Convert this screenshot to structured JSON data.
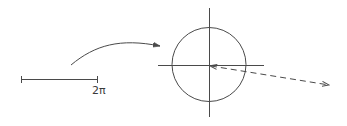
{
  "diagram": {
    "scale_bar": {
      "label": "2π"
    },
    "elements": [
      {
        "type": "scale-bar",
        "description": "horizontal segment with end ticks",
        "label": "2π"
      },
      {
        "type": "curved-arrow",
        "description": "mapping arrow from scale bar toward circle"
      },
      {
        "type": "unit-circle",
        "description": "circle centered on crossed axes"
      },
      {
        "type": "axes",
        "description": "horizontal and vertical axis lines through circle center"
      },
      {
        "type": "dashed-arrow",
        "description": "dashed double-headed arrow from circle center extending right-downward"
      }
    ],
    "colors": {
      "stroke": "#4a4a4a",
      "background": "#ffffff"
    }
  }
}
